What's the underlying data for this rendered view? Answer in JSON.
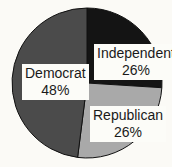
{
  "chart_data": {
    "type": "pie",
    "title": "",
    "categories": [
      "Independent",
      "Republican",
      "Democrat"
    ],
    "values": [
      26,
      26,
      48
    ],
    "unit": "%",
    "colors": [
      "#141414",
      "#a9a9a9",
      "#4b4b4b"
    ],
    "start_angle_deg": 0,
    "direction": "clockwise",
    "legend": "none",
    "slices": [
      {
        "name": "Independent",
        "value": 26,
        "label": "Independent",
        "pct_label": "26%",
        "color": "#141414"
      },
      {
        "name": "Republican",
        "value": 26,
        "label": "Republican",
        "pct_label": "26%",
        "color": "#a9a9a9"
      },
      {
        "name": "Democrat",
        "value": 48,
        "label": "Democrat",
        "pct_label": "48%",
        "color": "#4b4b4b"
      }
    ]
  },
  "labels": {
    "independent": {
      "name": "Independent",
      "pct": "26%"
    },
    "republican": {
      "name": "Republican",
      "pct": "26%"
    },
    "democrat": {
      "name": "Democrat",
      "pct": "48%"
    }
  }
}
